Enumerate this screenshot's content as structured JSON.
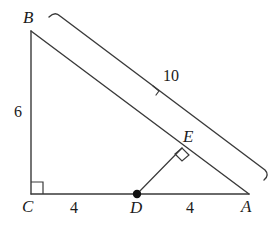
{
  "figure": {
    "kind": "geometry-diagram",
    "background_color": "#ffffff",
    "stroke_color": "#3a3a3a",
    "label_color": "#1b1b1b"
  },
  "vertices": {
    "B": {
      "label": "B",
      "x": 31,
      "y": 31
    },
    "C": {
      "label": "C",
      "x": 31,
      "y": 194
    },
    "A": {
      "label": "A",
      "x": 248,
      "y": 194
    },
    "D": {
      "label": "D",
      "x": 137,
      "y": 194
    },
    "E": {
      "label": "E",
      "x": 182,
      "y": 148
    }
  },
  "measurements": {
    "side_BC": "6",
    "side_CD": "4",
    "side_DA": "4",
    "hypotenuse_BA": "10"
  },
  "marks": {
    "right_angle_at_C": "right-angle-square",
    "right_angle_at_E": "right-angle-square",
    "point_D_marker": "filled-dot",
    "dimension_tick": "tick-mark"
  }
}
